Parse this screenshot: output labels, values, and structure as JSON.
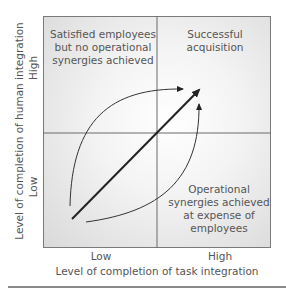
{
  "diagram": {
    "quadrants": {
      "top_left": [
        "Satisfied employees",
        "but no operational",
        "synergies achieved"
      ],
      "top_right": [
        "Successful",
        "acquisition"
      ],
      "bottom_right": [
        "Operational",
        "synergies achieved",
        "at expense of",
        "employees"
      ],
      "bottom_left": []
    },
    "y_axis": {
      "label": "Level of completion of human integration",
      "ticks": {
        "high": "High",
        "low": "Low"
      }
    },
    "x_axis": {
      "label": "Level of completion of task integration",
      "ticks": {
        "low": "Low",
        "high": "High"
      }
    },
    "arrows": [
      {
        "name": "direct-path",
        "from": "Low/Low",
        "to": "High/High",
        "style": "bold straight"
      },
      {
        "name": "human-first-path",
        "from": "Low/Low",
        "via": "High human integration",
        "to": "High/High",
        "style": "thin curve"
      },
      {
        "name": "task-first-path",
        "from": "Low/Low",
        "via": "High task integration",
        "to": "High/High",
        "style": "thin curve"
      }
    ],
    "colors": {
      "line": "#222222",
      "text": "#555555",
      "border": "#7a7a7a"
    }
  }
}
